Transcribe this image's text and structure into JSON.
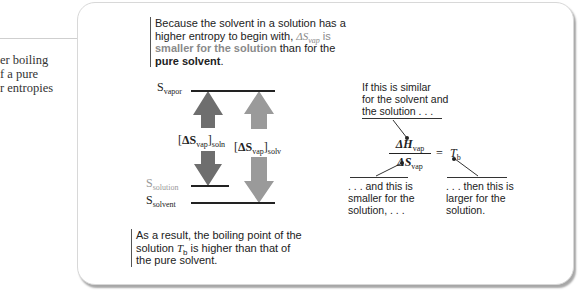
{
  "side_text": {
    "lines": [
      "er boiling",
      "f a pure",
      "r entropies"
    ]
  },
  "intro_callout": {
    "line1": "Because the solvent in a solution has a",
    "line2_pre": "higher entropy to begin with, ",
    "delta": "ΔS",
    "sub": "vap",
    "line2_post": " is",
    "highlight": "smaller for the solution",
    "line3_post": " than for the",
    "bold_end": "pure solvent",
    "period": "."
  },
  "levels": {
    "vapor": {
      "S": "S",
      "sub": "vapor"
    },
    "solution": {
      "S": "S",
      "sub": "solution"
    },
    "solvent": {
      "S": "S",
      "sub": "solvent"
    }
  },
  "arrows": {
    "soln": {
      "bracket_open": "[",
      "delta": "ΔS",
      "sub": "vap",
      "bracket_close": "]",
      "subscript": "soln",
      "color": "#6e6e6e"
    },
    "solv": {
      "bracket_open": "[",
      "delta": "ΔS",
      "sub": "vap",
      "bracket_close": "]",
      "subscript": "solv",
      "color": "#9a9a9a"
    }
  },
  "equation": {
    "numerator_delta": "ΔH",
    "numerator_sub": "vap",
    "denominator_delta": "ΔS",
    "denominator_sub": "vap",
    "equals": "=",
    "result": "T",
    "result_sub": "b"
  },
  "notes": {
    "top": [
      "If this is similar",
      "for the solvent and",
      "the solution . . ."
    ],
    "bottom_left": [
      ". . . and this is",
      "smaller for the",
      "solution, . . ."
    ],
    "bottom_right": [
      ". . . then this is",
      "larger for the",
      "solution."
    ]
  },
  "result_callout": {
    "line1": "As a result, the boiling point of the",
    "line2_pre": "solution ",
    "T": "T",
    "T_sub": "b",
    "line2_post": " is higher than that of",
    "line3": "the pure solvent."
  }
}
